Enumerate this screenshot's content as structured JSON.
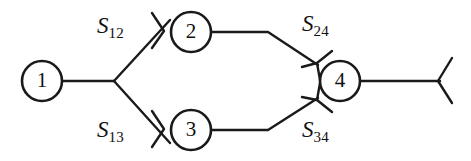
{
  "diagram": {
    "type": "signal-flow-graph",
    "stroke_color": "#1a1a1a",
    "background_color": "#ffffff",
    "nodes": [
      {
        "id": "node-1",
        "label": "1",
        "cx": 42,
        "cy": 81,
        "r": 20
      },
      {
        "id": "node-2",
        "label": "2",
        "cx": 191,
        "cy": 32,
        "r": 20
      },
      {
        "id": "node-3",
        "label": "3",
        "cx": 191,
        "cy": 130,
        "r": 20
      },
      {
        "id": "node-4",
        "label": "4",
        "cx": 340,
        "cy": 81,
        "r": 20
      }
    ],
    "edge_labels": [
      {
        "id": "label-s12",
        "base": "S",
        "sub": "12",
        "x": 97,
        "y": 14
      },
      {
        "id": "label-s24",
        "base": "S",
        "sub": "24",
        "x": 302,
        "y": 12
      },
      {
        "id": "label-s13",
        "base": "S",
        "sub": "13",
        "x": 97,
        "y": 118
      },
      {
        "id": "label-s34",
        "base": "S",
        "sub": "34",
        "x": 302,
        "y": 118
      }
    ],
    "edges": [
      {
        "id": "edge-in-1",
        "from": "input-port",
        "to": "node-1"
      },
      {
        "id": "edge-1-fork",
        "from": "node-1",
        "to": "fork-junction"
      },
      {
        "id": "edge-1-2",
        "from": "fork-junction",
        "to": "node-2",
        "label": "S12",
        "arrow": true
      },
      {
        "id": "edge-1-3",
        "from": "fork-junction",
        "to": "node-3",
        "label": "S13",
        "arrow": true
      },
      {
        "id": "edge-2-4",
        "from": "node-2",
        "to": "node-4",
        "label": "S24",
        "arrow": true
      },
      {
        "id": "edge-3-4",
        "from": "node-3",
        "to": "node-4",
        "label": "S34",
        "arrow": true
      },
      {
        "id": "edge-4-out",
        "from": "node-4",
        "to": "output-port",
        "arrow": true
      }
    ]
  }
}
